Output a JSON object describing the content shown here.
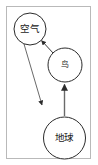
{
  "diagram": {
    "title": "",
    "frame": {
      "border_color": "#b9b9b9",
      "background": "#ffffff"
    },
    "node_style": {
      "stroke": "#2b2b2b",
      "fill": "#ffffff",
      "stroke_width": 1
    },
    "edge_style": {
      "stroke": "#3a3a3a",
      "stroke_width": 1,
      "arrowhead": "solid-triangle"
    },
    "nodes": [
      {
        "id": "air",
        "label": "空气",
        "cx": 30,
        "cy": 29,
        "r": 16
      },
      {
        "id": "bird",
        "label": "鸟",
        "cx": 65,
        "cy": 65,
        "r": 17
      },
      {
        "id": "earth",
        "label": "地球",
        "cx": 64.5,
        "cy": 138,
        "r": 21
      }
    ],
    "edges": [
      {
        "id": "bird-to-air",
        "from": "bird",
        "to": "air",
        "direction": "up-left",
        "arrow_at": "air"
      },
      {
        "id": "air-to-down",
        "from": "air",
        "to": "lower-left-point",
        "direction": "down-right",
        "arrow_at": "lower-left-point"
      },
      {
        "id": "earth-to-bird",
        "from": "earth",
        "to": "bird",
        "direction": "up",
        "arrow_at": "bird"
      }
    ]
  }
}
